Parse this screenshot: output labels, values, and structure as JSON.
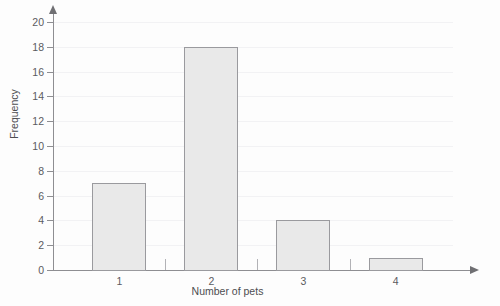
{
  "chart_data": {
    "type": "bar",
    "title": "",
    "xlabel": "Number of pets",
    "ylabel": "Frequency",
    "categories": [
      "1",
      "2",
      "3",
      "4"
    ],
    "values": [
      7,
      18,
      4,
      1
    ],
    "ylim": [
      0,
      20
    ],
    "ytick_step": 2,
    "yticks": [
      0,
      2,
      4,
      6,
      8,
      10,
      12,
      14,
      16,
      18,
      20
    ],
    "ytick_labels": [
      "0",
      "2",
      "4",
      "6",
      "8",
      "10",
      "12",
      "14",
      "16",
      "18",
      "20"
    ],
    "grid": true,
    "grid_axis": "y",
    "legend": null,
    "series": [
      {
        "name": "Frequency",
        "values": [
          7,
          18,
          4,
          1
        ]
      }
    ],
    "bar_fill_color": "#e9e9e9",
    "bar_edge_color": "#9a9a9e",
    "axis_color": "#8e8e92",
    "grid_color": "#f2f2f4",
    "background_color": "#fdfdfd",
    "text_color": "#5b5b5f"
  },
  "figure": {
    "cropped_title_text": " ",
    "x_axis_arrow": "arrow-right",
    "y_axis_arrow": "arrow-up"
  }
}
